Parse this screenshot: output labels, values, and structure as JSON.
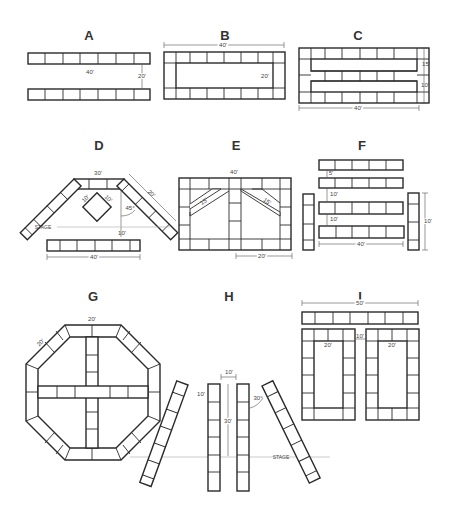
{
  "diagrams": {
    "A": {
      "label": "A",
      "length": "40'",
      "gap": "20'"
    },
    "B": {
      "label": "B",
      "length": "40'",
      "width": "20'"
    },
    "C": {
      "label": "C",
      "length": "40'",
      "upper_gap": "15'",
      "lower_gap": "10'"
    },
    "D": {
      "label": "D",
      "top": "30'",
      "side": "20'",
      "angle": "45°",
      "diamond_a": "10'",
      "diamond_b": "10'",
      "stage": "STAGE",
      "gap": "10'",
      "front": "40'"
    },
    "E": {
      "label": "E",
      "length": "40'",
      "diag_left": "15'",
      "diag_right": "15'",
      "half": "20'"
    },
    "F": {
      "label": "F",
      "gap1": "5'",
      "gap2": "10'",
      "gap3": "10'",
      "length": "40'",
      "side": "10'"
    },
    "G": {
      "label": "G",
      "top": "20'",
      "diag": "20'"
    },
    "H": {
      "label": "H",
      "spacing": "10'",
      "length": "30'",
      "side_gap": "10'",
      "angle": "30°",
      "stage": "STAGE"
    },
    "I": {
      "label": "I",
      "length": "50'",
      "gap": "10'",
      "left_inner": "20'",
      "right_inner": "20'"
    }
  },
  "colors": {
    "line": "#2a2a2a",
    "dimension": "#555555",
    "stage_line": "#aaaaaa",
    "background": "#ffffff"
  }
}
